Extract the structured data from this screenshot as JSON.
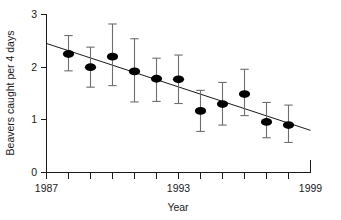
{
  "chart_data": {
    "type": "scatter",
    "title": "",
    "xlabel": "Year",
    "ylabel": "Beavers caught per 4 days",
    "xlim": [
      1987,
      1999
    ],
    "ylim": [
      0,
      3
    ],
    "grid": false,
    "legend": null,
    "x_tick_labels": [
      "1987",
      "1993",
      "1999"
    ],
    "x_tick_values": [
      1987,
      1993,
      1999
    ],
    "x_minor_tick_values": [
      1988,
      1989,
      1990,
      1991,
      1992,
      1994,
      1995,
      1996,
      1997,
      1998
    ],
    "y_tick_labels": [
      "0",
      "1",
      "2",
      "3"
    ],
    "y_tick_values": [
      0,
      1,
      2,
      3
    ],
    "x": [
      1988,
      1989,
      1990,
      1991,
      1992,
      1993,
      1994,
      1995,
      1996,
      1997,
      1998
    ],
    "values": [
      2.25,
      2.0,
      2.2,
      1.92,
      1.78,
      1.77,
      1.17,
      1.3,
      1.49,
      0.96,
      0.9
    ],
    "error_upper": [
      2.6,
      2.38,
      2.82,
      2.54,
      2.17,
      2.23,
      1.56,
      1.71,
      1.96,
      1.33,
      1.28
    ],
    "error_lower": [
      1.93,
      1.62,
      1.65,
      1.34,
      1.35,
      1.31,
      0.78,
      0.9,
      1.08,
      0.66,
      0.57
    ],
    "trendline": {
      "x_start": 1987,
      "y_start": 2.45,
      "x_end": 1999,
      "y_end": 0.8
    },
    "marker_color": "#000000",
    "errorbar_color": "#6e6e6e",
    "axis_color": "#1a1a1a"
  }
}
